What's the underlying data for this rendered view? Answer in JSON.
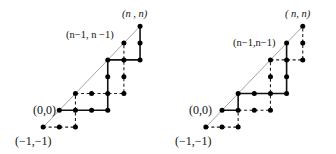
{
  "figures": [
    {
      "id": "left",
      "labels": {
        "origin": "(0,0)",
        "start": "(−1,−1)",
        "end": "(n , n)",
        "penultimate": "(n−1, n −1)"
      },
      "points": [
        [
          -1,
          -1
        ],
        [
          0,
          -1
        ],
        [
          1,
          -1
        ],
        [
          0,
          0
        ],
        [
          1,
          0
        ],
        [
          2,
          0
        ],
        [
          3,
          0
        ],
        [
          1,
          1
        ],
        [
          2,
          1
        ],
        [
          3,
          1
        ],
        [
          4,
          1
        ],
        [
          3,
          2
        ],
        [
          4,
          2
        ],
        [
          3,
          3
        ],
        [
          4,
          3
        ],
        [
          5,
          3
        ],
        [
          4,
          4
        ],
        [
          5,
          4
        ],
        [
          5,
          5
        ]
      ],
      "solid_paths": [
        [
          [
            0,
            0
          ],
          [
            1,
            0
          ],
          [
            2,
            0
          ],
          [
            3,
            0
          ],
          [
            3,
            1
          ],
          [
            3,
            2
          ],
          [
            3,
            3
          ],
          [
            4,
            3
          ],
          [
            5,
            3
          ],
          [
            5,
            4
          ],
          [
            5,
            5
          ]
        ]
      ],
      "dashed_paths": [
        [
          [
            -1,
            -1
          ],
          [
            0,
            -1
          ],
          [
            1,
            -1
          ],
          [
            1,
            0
          ],
          [
            1,
            1
          ],
          [
            2,
            1
          ],
          [
            3,
            1
          ],
          [
            4,
            1
          ],
          [
            4,
            2
          ],
          [
            4,
            3
          ],
          [
            4,
            4
          ]
        ]
      ],
      "diagonal": [
        [
          -1,
          -1
        ],
        [
          5,
          5
        ]
      ]
    },
    {
      "id": "right",
      "labels": {
        "origin": "(0,0)",
        "start": "(−1,−1)",
        "end": "( n,  n)",
        "penultimate": "(n−1,n−1)"
      },
      "points": [
        [
          -1,
          -1
        ],
        [
          0,
          -1
        ],
        [
          1,
          -1
        ],
        [
          0,
          0
        ],
        [
          1,
          0
        ],
        [
          2,
          0
        ],
        [
          3,
          0
        ],
        [
          1,
          1
        ],
        [
          2,
          1
        ],
        [
          3,
          1
        ],
        [
          4,
          1
        ],
        [
          3,
          2
        ],
        [
          4,
          2
        ],
        [
          3,
          3
        ],
        [
          4,
          3
        ],
        [
          5,
          3
        ],
        [
          4,
          4
        ],
        [
          5,
          4
        ],
        [
          5,
          5
        ]
      ],
      "solid_paths": [
        [
          [
            0,
            0
          ],
          [
            1,
            0
          ],
          [
            1,
            1
          ],
          [
            2,
            1
          ],
          [
            3,
            1
          ],
          [
            4,
            1
          ],
          [
            4,
            2
          ],
          [
            4,
            3
          ],
          [
            4,
            4
          ]
        ]
      ],
      "dashed_paths": [
        [
          [
            -1,
            -1
          ],
          [
            0,
            -1
          ],
          [
            1,
            -1
          ],
          [
            1,
            0
          ],
          [
            2,
            0
          ],
          [
            3,
            0
          ],
          [
            3,
            1
          ],
          [
            3,
            2
          ],
          [
            3,
            3
          ],
          [
            4,
            3
          ],
          [
            5,
            3
          ],
          [
            5,
            4
          ],
          [
            5,
            5
          ]
        ]
      ],
      "diagonal": [
        [
          -1,
          -1
        ],
        [
          5,
          5
        ]
      ]
    }
  ]
}
